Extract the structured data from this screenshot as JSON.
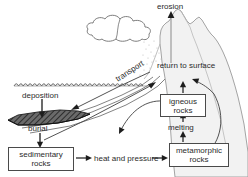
{
  "diagram": {
    "colors": {
      "line": "#4a4a4a",
      "text": "#2b2b2b",
      "mountain_fill": "#f2f2f2",
      "mountain_stroke": "#8c8c8c",
      "cloud_stroke": "#6e6e6e",
      "sediment_fill": "#555555",
      "water_line": "#555555",
      "background": "#ffffff"
    },
    "labels": {
      "erosion": "erosion",
      "transport": "transport",
      "return_to_surface": "return to surface",
      "deposition": "deposition",
      "burial": "burial",
      "melting": "melting",
      "heat_and_pressure": "heat and pressure"
    },
    "boxes": {
      "sedimentary_rocks": {
        "line1": "sedimentary",
        "line2": "rocks"
      },
      "igneous_rocks": {
        "line1": "igneous",
        "line2": "rocks"
      },
      "metamorphic_rocks": {
        "line1": "metamorphic",
        "line2": "rocks"
      }
    },
    "scene": {
      "cloud": "cloud-shape",
      "mountain": "mountain-silhouette",
      "water_surface": "wavy-water-line",
      "sediment_wedge": "hatched-sediment-layer",
      "rain": "rain-dots"
    }
  }
}
